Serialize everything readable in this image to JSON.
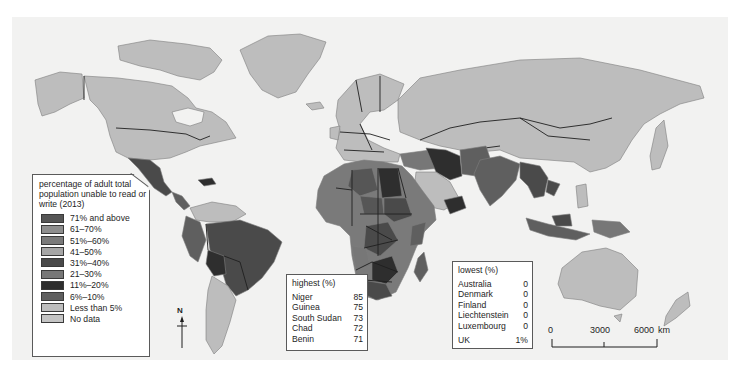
{
  "map": {
    "subject": "Adult illiteracy by country (2013)",
    "colors": {
      "ocean": "#f2f2f1",
      "71_and_above": "#565656",
      "61_70": "#8e8e8e",
      "51_60": "#7a7a7a",
      "41_50": "#a6a6a6",
      "31_40": "#4a4a4a",
      "21_30": "#777777",
      "11_20": "#2e2e2e",
      "6_10": "#5f5f5f",
      "less_than_5": "#bdbdbd",
      "no_data": "#c4c4c4"
    }
  },
  "legend": {
    "title": "percentage of adult total population unable to read or write (2013)",
    "items": [
      {
        "label": "71% and above",
        "color": "#565656"
      },
      {
        "label": "61–70%",
        "color": "#8e8e8e"
      },
      {
        "label": "51%–60%",
        "color": "#7a7a7a"
      },
      {
        "label": "41–50%",
        "color": "#a6a6a6"
      },
      {
        "label": "31%–40%",
        "color": "#4a4a4a"
      },
      {
        "label": "21–30%",
        "color": "#777777"
      },
      {
        "label": "11%–20%",
        "color": "#2e2e2e"
      },
      {
        "label": "6%–10%",
        "color": "#5f5f5f"
      },
      {
        "label": "Less than 5%",
        "color": "#bdbdbd"
      },
      {
        "label": "No data",
        "color": "#c4c4c4"
      }
    ]
  },
  "highest": {
    "title": "highest (%)",
    "rows": [
      {
        "country": "Niger",
        "value": "85"
      },
      {
        "country": "Guinea",
        "value": "75"
      },
      {
        "country": "South Sudan",
        "value": "73"
      },
      {
        "country": "Chad",
        "value": "72"
      },
      {
        "country": "Benin",
        "value": "71"
      }
    ]
  },
  "lowest": {
    "title": "lowest (%)",
    "rows": [
      {
        "country": "Australia",
        "value": "0"
      },
      {
        "country": "Denmark",
        "value": "0"
      },
      {
        "country": "Finland",
        "value": "0"
      },
      {
        "country": "Liechtenstein",
        "value": "0"
      },
      {
        "country": "Luxembourg",
        "value": "0"
      }
    ],
    "extra": {
      "country": "UK",
      "value": "1%"
    }
  },
  "scale_bar": {
    "ticks": [
      "0",
      "3000",
      "6000"
    ],
    "unit": "km"
  },
  "north_arrow": {
    "label": "N"
  }
}
